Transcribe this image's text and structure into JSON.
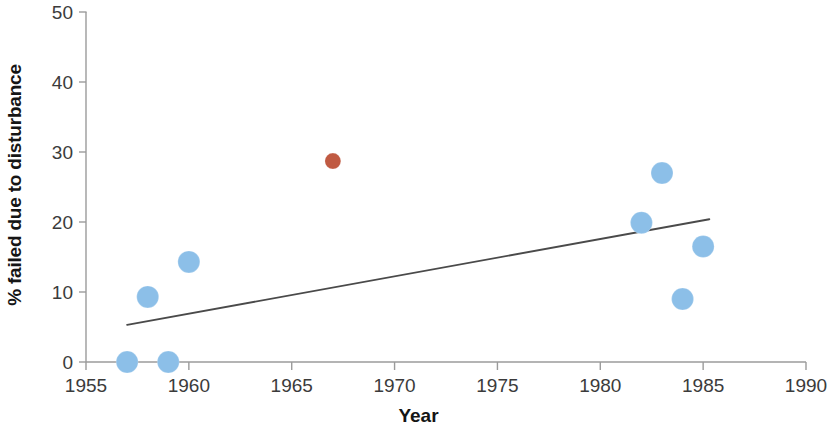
{
  "chart_data": {
    "type": "scatter",
    "title": "",
    "xlabel": "Year",
    "ylabel": "% failed due to disturbance",
    "xlim": [
      1955,
      1990
    ],
    "ylim": [
      0,
      50
    ],
    "xticks": [
      1955,
      1960,
      1965,
      1970,
      1975,
      1980,
      1985,
      1990
    ],
    "xtick_labels": [
      "1955",
      "1960",
      "1965",
      "1970",
      "1975",
      "1980",
      "1985",
      "1990"
    ],
    "yticks": [
      0,
      10,
      20,
      30,
      40,
      50
    ],
    "ytick_labels": [
      "0",
      "10",
      "20",
      "30",
      "40",
      "50"
    ],
    "grid": false,
    "legend": false,
    "series": [
      {
        "name": "observations",
        "color": "#8cbfe8",
        "marker": "circle",
        "marker_size": 22,
        "points": [
          {
            "x": 1957,
            "y": 0.0
          },
          {
            "x": 1958,
            "y": 9.3
          },
          {
            "x": 1959,
            "y": 0.0
          },
          {
            "x": 1960,
            "y": 14.3
          },
          {
            "x": 1982,
            "y": 19.9
          },
          {
            "x": 1983,
            "y": 27.0
          },
          {
            "x": 1984,
            "y": 9.0
          },
          {
            "x": 1985,
            "y": 16.5
          }
        ]
      },
      {
        "name": "outlier",
        "color": "#c05a42",
        "marker": "circle",
        "marker_size": 16,
        "points": [
          {
            "x": 1967,
            "y": 28.7
          }
        ]
      }
    ],
    "trendline": {
      "name": "linear trend",
      "color": "#4a4a4a",
      "x_start": 1957,
      "y_start": 5.3,
      "x_end": 1985.3,
      "y_end": 20.4
    }
  },
  "axes": {
    "y_title": "% failed due to disturbance",
    "x_title": "Year"
  }
}
